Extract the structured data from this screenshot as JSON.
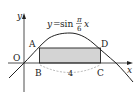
{
  "diagram": {
    "type": "function-graph",
    "function_label": {
      "y": "y",
      "eq": "=",
      "func": "sin",
      "frac_num": "π",
      "frac_den": "6",
      "var": "x"
    },
    "axes": {
      "x_label": "x",
      "y_label": "y",
      "origin_label": "O"
    },
    "points": {
      "A": "A",
      "B": "B",
      "C": "C",
      "D": "D"
    },
    "segment_BC_length": "4",
    "colors": {
      "line": "#222222",
      "rect_fill": "#d4d4d4",
      "dashed": "#888888"
    }
  }
}
